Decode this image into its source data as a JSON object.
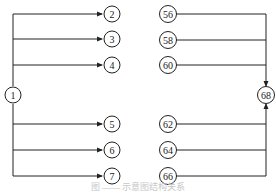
{
  "diagram": {
    "left": {
      "source": "1",
      "targets": [
        "2",
        "3",
        "4",
        "5",
        "6",
        "7"
      ]
    },
    "right": {
      "sources": [
        "56",
        "58",
        "60",
        "62",
        "64",
        "66"
      ],
      "target": "68"
    }
  },
  "caption": "图 —— 示意图结构关系"
}
